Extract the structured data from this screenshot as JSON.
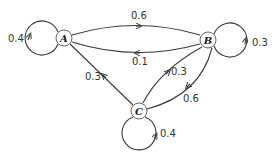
{
  "diagram": {
    "type": "markov-chain",
    "nodes": [
      {
        "id": "A",
        "label": "A"
      },
      {
        "id": "B",
        "label": "B"
      },
      {
        "id": "C",
        "label": "C"
      }
    ],
    "edges": [
      {
        "from": "A",
        "to": "A",
        "label": "0.4"
      },
      {
        "from": "A",
        "to": "B",
        "label": "0.6"
      },
      {
        "from": "B",
        "to": "A",
        "label": "0.1"
      },
      {
        "from": "B",
        "to": "B",
        "label": "0.3"
      },
      {
        "from": "B",
        "to": "C",
        "label": "0.6"
      },
      {
        "from": "C",
        "to": "B",
        "label": "0.3"
      },
      {
        "from": "C",
        "to": "A",
        "label": "0.3"
      },
      {
        "from": "C",
        "to": "C",
        "label": "0.4"
      }
    ]
  }
}
